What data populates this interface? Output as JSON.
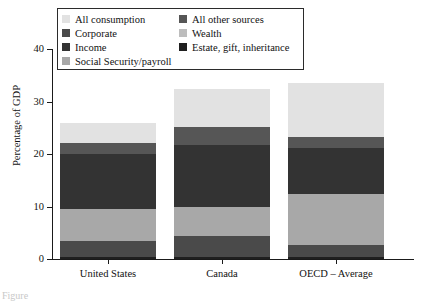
{
  "figure": {
    "ylabel": "Percentage of GDP",
    "caption_fragment": "Figure"
  },
  "legend": {
    "left_column": [
      {
        "label": "All consumption",
        "color": "#e2e2e2",
        "key": "all_consumption"
      },
      {
        "label": "Corporate",
        "color": "#4a4a4a",
        "key": "corporate"
      },
      {
        "label": "Income",
        "color": "#333333",
        "key": "income"
      },
      {
        "label": "Social Security/payroll",
        "color": "#a8a8a8",
        "key": "social_security_payroll"
      }
    ],
    "right_column": [
      {
        "label": "All other sources",
        "color": "#565656",
        "key": "all_other_sources"
      },
      {
        "label": "Wealth",
        "color": "#bdbdbd",
        "key": "wealth"
      },
      {
        "label": "Estate, gift, inheritance",
        "color": "#1f1f1f",
        "key": "estate_gift_inheritance"
      }
    ]
  },
  "yaxis": {
    "ticks": [
      {
        "value": 0,
        "label": "0"
      },
      {
        "value": 10,
        "label": "10"
      },
      {
        "value": 20,
        "label": "20"
      },
      {
        "value": 30,
        "label": "30"
      },
      {
        "value": 40,
        "label": "40"
      }
    ],
    "min": 0,
    "max": 40
  },
  "xaxis": {
    "categories": [
      "United States",
      "Canada",
      "OECD – Average"
    ]
  },
  "chart_data": {
    "type": "bar",
    "stacked": true,
    "title": "",
    "xlabel": "",
    "ylabel": "Percentage of GDP",
    "ylim": [
      0,
      40
    ],
    "grid": false,
    "legend_position": "top-inside",
    "categories": [
      "United States",
      "Canada",
      "OECD – Average"
    ],
    "series": [
      {
        "name": "Estate, gift, inheritance",
        "color": "#1f1f1f",
        "values": [
          0.3,
          0.3,
          0.3
        ]
      },
      {
        "name": "Corporate",
        "color": "#4a4a4a",
        "values": [
          3.1,
          4.0,
          2.3
        ]
      },
      {
        "name": "Social Security/payroll",
        "color": "#a8a8a8",
        "values": [
          6.2,
          5.5,
          9.7
        ]
      },
      {
        "name": "Income",
        "color": "#333333",
        "values": [
          10.4,
          11.5,
          11.0
        ]
      },
      {
        "name": "Wealth",
        "color": "#565656",
        "values": [
          2.1,
          3.4,
          0.0
        ]
      },
      {
        "name": "All other sources",
        "color": "#565656",
        "values": [
          0.0,
          0.0,
          0.0
        ]
      },
      {
        "name": "All consumption",
        "color": "#e2e2e2",
        "values": [
          3.9,
          7.2,
          10.2
        ]
      }
    ],
    "totals": [
      26.0,
      32.4,
      33.5
    ]
  },
  "bars": [
    {
      "category": "United States",
      "total": 26.0,
      "segments": [
        {
          "name": "Estate, gift, inheritance",
          "from": 0.0,
          "to": 0.3,
          "color": "#1f1f1f"
        },
        {
          "name": "Corporate",
          "from": 0.3,
          "to": 3.4,
          "color": "#4a4a4a"
        },
        {
          "name": "Social Security/payroll",
          "from": 3.4,
          "to": 9.6,
          "color": "#a8a8a8"
        },
        {
          "name": "Income",
          "from": 9.6,
          "to": 20.0,
          "color": "#333333"
        },
        {
          "name": "Wealth",
          "from": 20.0,
          "to": 22.1,
          "color": "#565656"
        },
        {
          "name": "All consumption",
          "from": 22.1,
          "to": 26.0,
          "color": "#e2e2e2"
        }
      ]
    },
    {
      "category": "Canada",
      "total": 32.4,
      "segments": [
        {
          "name": "Estate, gift, inheritance",
          "from": 0.0,
          "to": 0.3,
          "color": "#1f1f1f"
        },
        {
          "name": "Corporate",
          "from": 0.3,
          "to": 4.3,
          "color": "#4a4a4a"
        },
        {
          "name": "Social Security/payroll",
          "from": 4.3,
          "to": 10.0,
          "color": "#a8a8a8"
        },
        {
          "name": "Income",
          "from": 10.0,
          "to": 21.8,
          "color": "#333333"
        },
        {
          "name": "Wealth",
          "from": 21.8,
          "to": 25.2,
          "color": "#565656"
        },
        {
          "name": "All consumption",
          "from": 25.2,
          "to": 32.4,
          "color": "#e2e2e2"
        }
      ]
    },
    {
      "category": "OECD – Average",
      "total": 33.5,
      "segments": [
        {
          "name": "Estate, gift, inheritance",
          "from": 0.0,
          "to": 0.3,
          "color": "#1f1f1f"
        },
        {
          "name": "Corporate",
          "from": 0.3,
          "to": 2.6,
          "color": "#4a4a4a"
        },
        {
          "name": "Social Security/payroll",
          "from": 2.6,
          "to": 12.3,
          "color": "#a8a8a8"
        },
        {
          "name": "Income",
          "from": 12.3,
          "to": 21.1,
          "color": "#333333"
        },
        {
          "name": "Wealth",
          "from": 21.1,
          "to": 23.3,
          "color": "#565656"
        },
        {
          "name": "All consumption",
          "from": 23.3,
          "to": 33.5,
          "color": "#e2e2e2"
        }
      ]
    }
  ]
}
